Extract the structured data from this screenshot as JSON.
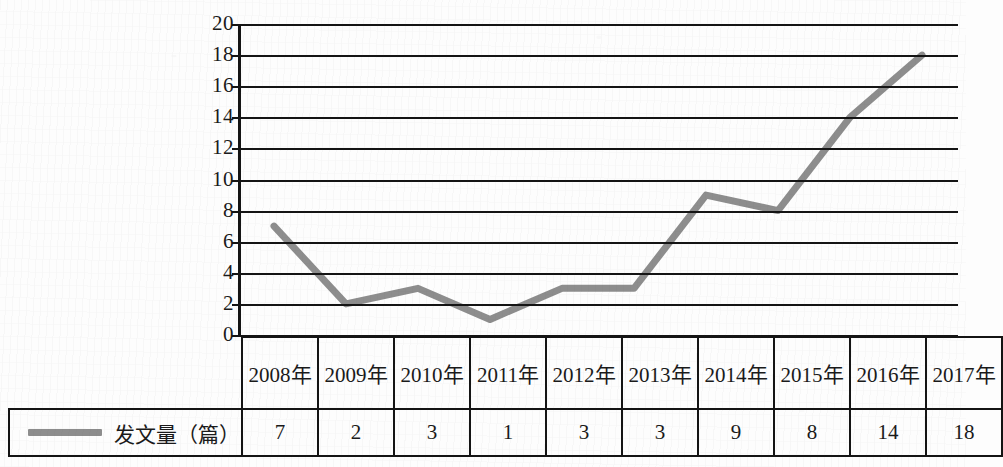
{
  "chart_data": {
    "type": "line",
    "title": "",
    "xlabel": "",
    "ylabel": "",
    "categories": [
      "2008年",
      "2009年",
      "2010年",
      "2011年",
      "2012年",
      "2013年",
      "2014年",
      "2015年",
      "2016年",
      "2017年"
    ],
    "series": [
      {
        "name": "发文量（篇）",
        "values": [
          7,
          2,
          3,
          1,
          3,
          3,
          9,
          8,
          14,
          18
        ],
        "color": "#8d8d8d"
      }
    ],
    "ylim": [
      0,
      20
    ],
    "yticks": [
      20,
      18,
      16,
      14,
      12,
      10,
      8,
      6,
      4,
      2,
      0
    ],
    "grid": true,
    "legend_position": "table-row-left",
    "has_data_table": true
  },
  "legend": {
    "swatch_icon": "line-swatch-icon",
    "label": "发文量（篇）",
    "color": "#8d8d8d"
  },
  "table": {
    "header_row": [
      "2008年",
      "2009年",
      "2010年",
      "2011年",
      "2012年",
      "2013年",
      "2014年",
      "2015年",
      "2016年",
      "2017年"
    ],
    "value_row": [
      "7",
      "2",
      "3",
      "1",
      "3",
      "3",
      "9",
      "8",
      "14",
      "18"
    ],
    "row_label": "发文量（篇）"
  },
  "colors": {
    "series_line": "#8d8d8d",
    "axis": "#141414",
    "gridline": "#141414",
    "text": "#1a1a1a",
    "background": "#fdfdfd"
  }
}
